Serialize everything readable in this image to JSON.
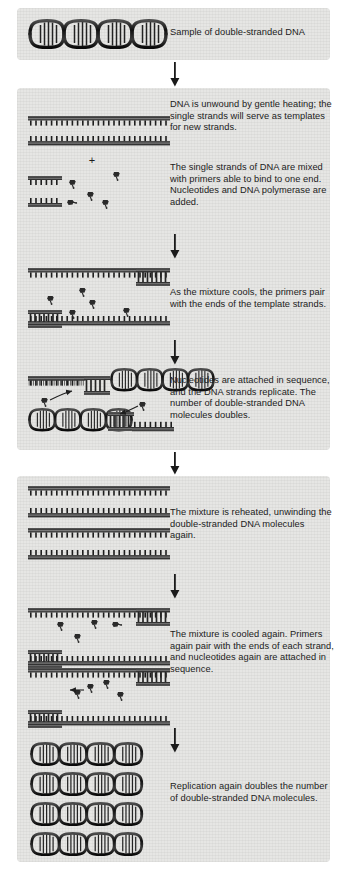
{
  "figure": {
    "background_color": "#ffffff",
    "panel_color": "#e6e6e4",
    "ink_color": "#1b1b1b",
    "width": 353,
    "height": 872
  },
  "steps": [
    {
      "id": "step-1",
      "name": "sample-double-stranded-dna",
      "caption": "Sample of double-stranded DNA",
      "art": "double-helix-single",
      "panel": {
        "x": 17,
        "y": 8,
        "w": 313,
        "h": 52
      },
      "caption_box": {
        "x": 170,
        "y": 28,
        "w": 160
      },
      "helices": 1
    },
    {
      "id": "step-2",
      "name": "denaturation-and-mixing",
      "caption": "DNA is unwound by gentle heating; the single strands will serve as templates for new strands.",
      "caption2": "The single strands of DNA are mixed with primers able to bind to one end. Nucleotides and DNA polymerase are added.",
      "art": "separated-strands-plus-primers",
      "caption_box": {
        "x": 170,
        "y": 100,
        "w": 162
      },
      "caption2_box": {
        "x": 170,
        "y": 163,
        "w": 162
      },
      "plus_sign": "+"
    },
    {
      "id": "step-3",
      "name": "primer-annealing",
      "caption": "As the mixture cools, the primers pair with the ends of the template strands.",
      "art": "templates-with-annealed-primers",
      "caption_box": {
        "x": 170,
        "y": 288,
        "w": 168
      }
    },
    {
      "id": "step-4",
      "name": "extension-first-cycle",
      "caption": "Nucleotides are attached in sequence, and the DNA strands replicate. The number of double-stranded DNA molecules doubles.",
      "art": "half-helix-half-strand",
      "caption_box": {
        "x": 170,
        "y": 376,
        "w": 166
      }
    },
    {
      "id": "step-5",
      "name": "second-denaturation",
      "caption": "The mixture is reheated, unwinding the double-stranded DNA molecules again.",
      "art": "four-single-strands",
      "caption_box": {
        "x": 170,
        "y": 508,
        "w": 162
      },
      "strand_count": 4
    },
    {
      "id": "step-6",
      "name": "second-annealing-and-extension",
      "caption": "The mixture is cooled again. Primers again pair with the ends of each strand, and nucleotides again are attached in sequence.",
      "art": "two-duplex-with-primers",
      "caption_box": {
        "x": 170,
        "y": 630,
        "w": 168
      }
    },
    {
      "id": "step-7",
      "name": "replication-doubles-again",
      "caption": "Replication again doubles the number of double-stranded DNA molecules.",
      "art": "four-double-helices",
      "caption_box": {
        "x": 170,
        "y": 782,
        "w": 162
      },
      "helices": 4
    }
  ],
  "panels": [
    {
      "name": "panel-sample",
      "x": 17,
      "y": 8,
      "w": 313,
      "h": 52
    },
    {
      "name": "panel-cycle-one",
      "x": 17,
      "y": 88,
      "w": 313,
      "h": 362
    },
    {
      "name": "panel-cycle-two",
      "x": 17,
      "y": 476,
      "w": 313,
      "h": 386
    }
  ],
  "arrows": [
    {
      "name": "arrow-sample-to-cycle-one",
      "x": 175,
      "y": 60,
      "h": 27
    },
    {
      "name": "arrow-denature-to-anneal",
      "x": 175,
      "y": 232,
      "h": 28
    },
    {
      "name": "arrow-anneal-to-extend",
      "x": 175,
      "y": 338,
      "h": 28
    },
    {
      "name": "arrow-cycle-one-to-cycle-two",
      "x": 175,
      "y": 450,
      "h": 26
    },
    {
      "name": "arrow-denature-to-anneal-two",
      "x": 175,
      "y": 580,
      "h": 28
    },
    {
      "name": "arrow-anneal-to-replicate-two",
      "x": 175,
      "y": 712,
      "h": 28
    }
  ]
}
